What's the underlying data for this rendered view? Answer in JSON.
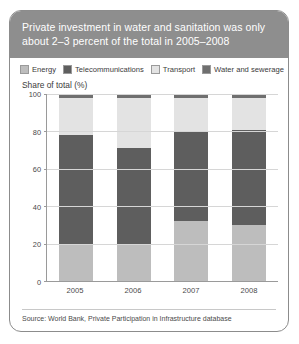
{
  "card": {
    "title": "Private investment in water and sanitation was only about 2–3 percent of the total in 2005–2008",
    "source": "Source: World Bank, Private Participation in Infrastructure database"
  },
  "colors": {
    "title_band": "#8e8e8e",
    "energy": "#bdbdbd",
    "telecommunications": "#5e5e5e",
    "transport": "#e3e3e3",
    "water_and_sewerage": "#6f6f6f",
    "grid": "#d6d6d6",
    "axis": "#9a9a9a"
  },
  "legend": {
    "items": [
      {
        "label": "Energy",
        "color": "#bdbdbd"
      },
      {
        "label": "Telecommunications",
        "color": "#5e5e5e"
      },
      {
        "label": "Transport",
        "color": "#e3e3e3"
      },
      {
        "label": "Water and sewerage",
        "color": "#6f6f6f"
      }
    ]
  },
  "chart_data": {
    "type": "bar",
    "stacked": true,
    "title": "Private investment in water and sanitation was only about 2–3 percent of the total in 2005–2008",
    "subtitle": "",
    "xlabel": "",
    "ylabel": "Share of total (%)",
    "ylim": [
      0,
      100
    ],
    "yticks": [
      0,
      20,
      40,
      60,
      80,
      100
    ],
    "grid": true,
    "legend_position": "top",
    "categories": [
      "2005",
      "2006",
      "2007",
      "2008"
    ],
    "series": [
      {
        "name": "Energy",
        "color": "#bdbdbd",
        "values": [
          19,
          20,
          32,
          30
        ]
      },
      {
        "name": "Telecommunications",
        "color": "#5e5e5e",
        "values": [
          59,
          51,
          48,
          51
        ]
      },
      {
        "name": "Transport",
        "color": "#e3e3e3",
        "values": [
          20,
          27,
          18,
          17
        ]
      },
      {
        "name": "Water and sewerage",
        "color": "#6f6f6f",
        "values": [
          2,
          2,
          2,
          2
        ]
      }
    ],
    "annotations": [
      "Water and sanitation is only 2–3 percent of the total in 2005–2008"
    ]
  }
}
